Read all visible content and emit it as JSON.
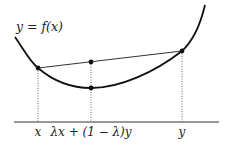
{
  "diagram": {
    "function_label": "y = f(x)",
    "axis_labels": {
      "left": "x",
      "middle": "λx + (1 − λ)y",
      "right": "y"
    },
    "colors": {
      "curve": "#111111",
      "chord": "#333333",
      "axis": "#333333",
      "guides": "#555555",
      "points": "#111111"
    }
  }
}
